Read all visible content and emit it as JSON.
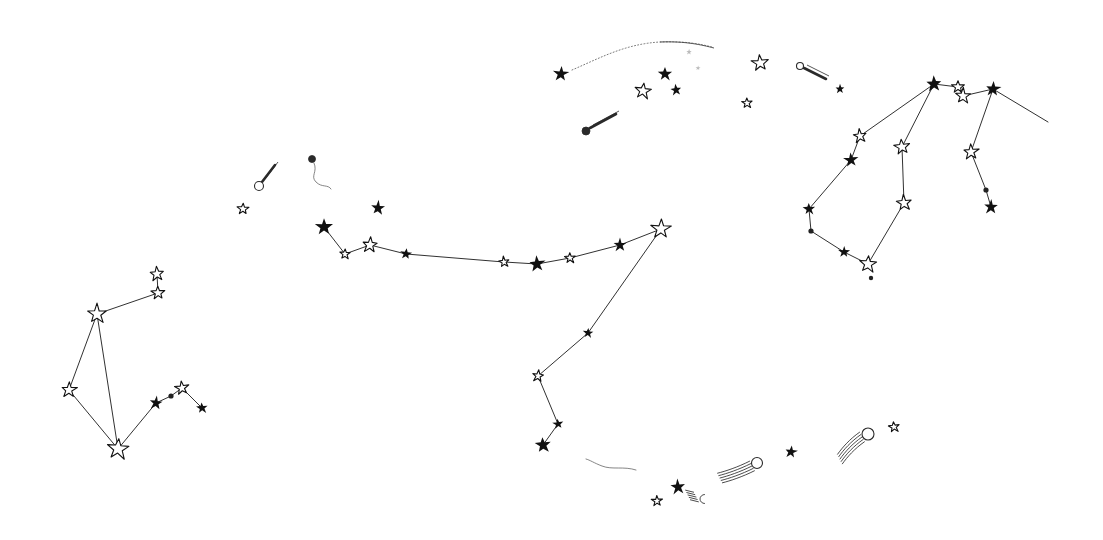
{
  "meta": {
    "background_color": "#ffffff",
    "ink_color": "#111111",
    "comet_ink_color": "#2a2a2a",
    "width": 1103,
    "height": 540
  },
  "chart_data": {
    "type": "scatter",
    "subtitle": "",
    "xlabel": "",
    "ylabel": "",
    "xlim": [
      0,
      1103
    ],
    "ylim": [
      0,
      540
    ],
    "grid": false,
    "legend": null,
    "annotations": [],
    "constellations": [
      {
        "name": "lower-left-group",
        "stars": [
          {
            "id": "ll1",
            "x": 157,
            "y": 274,
            "r": 7.5,
            "style": "open"
          },
          {
            "id": "ll2",
            "x": 158,
            "y": 293,
            "r": 7.0,
            "style": "open"
          },
          {
            "id": "ll3",
            "x": 97,
            "y": 314,
            "r": 10.0,
            "style": "open"
          },
          {
            "id": "ll4",
            "x": 69,
            "y": 390,
            "r": 8.0,
            "style": "open"
          },
          {
            "id": "ll5",
            "x": 118,
            "y": 449,
            "r": 11.0,
            "style": "open"
          },
          {
            "id": "ll6",
            "x": 156,
            "y": 403,
            "r": 7.0,
            "style": "solid"
          },
          {
            "id": "ll7",
            "x": 182,
            "y": 388,
            "r": 7.0,
            "style": "open"
          },
          {
            "id": "ll8",
            "x": 202,
            "y": 408,
            "r": 6.0,
            "style": "solid"
          },
          {
            "id": "ll9",
            "x": 171,
            "y": 396,
            "r": 2.6,
            "style": "solid"
          }
        ],
        "links": [
          [
            "ll1",
            "ll2"
          ],
          [
            "ll2",
            "ll3"
          ],
          [
            "ll3",
            "ll4"
          ],
          [
            "ll3",
            "ll5"
          ],
          [
            "ll4",
            "ll5"
          ],
          [
            "ll5",
            "ll6"
          ],
          [
            "ll6",
            "ll9"
          ],
          [
            "ll9",
            "ll7"
          ],
          [
            "ll7",
            "ll8"
          ]
        ]
      },
      {
        "name": "central-chain",
        "stars": [
          {
            "id": "c1",
            "x": 324,
            "y": 227,
            "r": 9.0,
            "style": "solid"
          },
          {
            "id": "c2",
            "x": 345,
            "y": 254,
            "r": 5.5,
            "style": "open"
          },
          {
            "id": "c3",
            "x": 370,
            "y": 245,
            "r": 8.0,
            "style": "open"
          },
          {
            "id": "c4",
            "x": 406,
            "y": 254,
            "r": 6.0,
            "style": "solid"
          },
          {
            "id": "c5",
            "x": 504,
            "y": 262,
            "r": 5.5,
            "style": "open"
          },
          {
            "id": "c6",
            "x": 537,
            "y": 264,
            "r": 8.5,
            "style": "solid"
          },
          {
            "id": "c7",
            "x": 570,
            "y": 258,
            "r": 5.5,
            "style": "open"
          },
          {
            "id": "c8",
            "x": 620,
            "y": 245,
            "r": 7.0,
            "style": "solid"
          },
          {
            "id": "c9",
            "x": 661,
            "y": 229,
            "r": 10.0,
            "style": "open"
          },
          {
            "id": "c10",
            "x": 588,
            "y": 333,
            "r": 5.5,
            "style": "solid"
          },
          {
            "id": "c11",
            "x": 538,
            "y": 376,
            "r": 6.0,
            "style": "open"
          },
          {
            "id": "c12",
            "x": 558,
            "y": 424,
            "r": 5.5,
            "style": "solid"
          },
          {
            "id": "c13",
            "x": 543,
            "y": 445,
            "r": 8.5,
            "style": "solid"
          }
        ],
        "links": [
          [
            "c1",
            "c2"
          ],
          [
            "c2",
            "c3"
          ],
          [
            "c3",
            "c4"
          ],
          [
            "c4",
            "c5"
          ],
          [
            "c5",
            "c6"
          ],
          [
            "c6",
            "c7"
          ],
          [
            "c7",
            "c8"
          ],
          [
            "c8",
            "c9"
          ],
          [
            "c9",
            "c10"
          ],
          [
            "c10",
            "c11"
          ],
          [
            "c11",
            "c12"
          ],
          [
            "c12",
            "c13"
          ]
        ]
      },
      {
        "name": "right-group",
        "stars": [
          {
            "id": "r1",
            "x": 934,
            "y": 84,
            "r": 8.5,
            "style": "solid"
          },
          {
            "id": "r2",
            "x": 958,
            "y": 87,
            "r": 6.5,
            "style": "open"
          },
          {
            "id": "r3",
            "x": 963,
            "y": 96,
            "r": 8.0,
            "style": "open"
          },
          {
            "id": "r4",
            "x": 993,
            "y": 89,
            "r": 8.0,
            "style": "solid"
          },
          {
            "id": "r5",
            "x": 1048,
            "y": 122,
            "r": 2.0,
            "style": "none"
          },
          {
            "id": "r6",
            "x": 860,
            "y": 136,
            "r": 7.0,
            "style": "open"
          },
          {
            "id": "r7",
            "x": 851,
            "y": 160,
            "r": 7.5,
            "style": "solid"
          },
          {
            "id": "r8",
            "x": 809,
            "y": 209,
            "r": 6.5,
            "style": "solid"
          },
          {
            "id": "r9",
            "x": 811,
            "y": 231,
            "r": 2.6,
            "style": "solid"
          },
          {
            "id": "r10",
            "x": 844,
            "y": 252,
            "r": 6.0,
            "style": "solid"
          },
          {
            "id": "r11",
            "x": 868,
            "y": 264,
            "r": 9.0,
            "style": "open"
          },
          {
            "id": "r12",
            "x": 871,
            "y": 278,
            "r": 2.2,
            "style": "solid"
          },
          {
            "id": "r13",
            "x": 902,
            "y": 147,
            "r": 8.0,
            "style": "open"
          },
          {
            "id": "r14",
            "x": 904,
            "y": 203,
            "r": 8.0,
            "style": "open"
          },
          {
            "id": "r15",
            "x": 971,
            "y": 152,
            "r": 8.0,
            "style": "open"
          },
          {
            "id": "r16",
            "x": 986,
            "y": 190,
            "r": 2.6,
            "style": "solid"
          },
          {
            "id": "r17",
            "x": 991,
            "y": 207,
            "r": 7.5,
            "style": "solid"
          }
        ],
        "links": [
          [
            "r1",
            "r2"
          ],
          [
            "r2",
            "r3"
          ],
          [
            "r3",
            "r4"
          ],
          [
            "r4",
            "r5"
          ],
          [
            "r1",
            "r6"
          ],
          [
            "r6",
            "r7"
          ],
          [
            "r7",
            "r8"
          ],
          [
            "r8",
            "r9"
          ],
          [
            "r9",
            "r10"
          ],
          [
            "r10",
            "r11"
          ],
          [
            "r1",
            "r13"
          ],
          [
            "r13",
            "r14"
          ],
          [
            "r14",
            "r11"
          ],
          [
            "r4",
            "r15"
          ],
          [
            "r15",
            "r16"
          ],
          [
            "r16",
            "r17"
          ]
        ]
      }
    ],
    "field_stars": [
      {
        "x": 561,
        "y": 74,
        "r": 8.0,
        "style": "solid"
      },
      {
        "x": 643,
        "y": 91,
        "r": 8.5,
        "style": "open"
      },
      {
        "x": 676,
        "y": 90,
        "r": 6.0,
        "style": "solid"
      },
      {
        "x": 760,
        "y": 63,
        "r": 8.5,
        "style": "open"
      },
      {
        "x": 747,
        "y": 103,
        "r": 5.5,
        "style": "open"
      },
      {
        "x": 840,
        "y": 89,
        "r": 5.0,
        "style": "solid"
      },
      {
        "x": 243,
        "y": 209,
        "r": 6.0,
        "style": "open"
      },
      {
        "x": 378,
        "y": 208,
        "r": 7.5,
        "style": "solid"
      },
      {
        "x": 791,
        "y": 452,
        "r": 6.5,
        "style": "solid"
      },
      {
        "x": 894,
        "y": 427,
        "r": 5.5,
        "style": "open"
      },
      {
        "x": 678,
        "y": 487,
        "r": 8.0,
        "style": "solid"
      },
      {
        "x": 657,
        "y": 501,
        "r": 5.5,
        "style": "open"
      },
      {
        "x": 665,
        "y": 74,
        "r": 7.5,
        "style": "solid"
      },
      {
        "x": 689,
        "y": 52,
        "r": 3.0,
        "style": "faint"
      },
      {
        "x": 698,
        "y": 68,
        "r": 2.5,
        "style": "faint"
      }
    ],
    "comets": [
      {
        "name": "comet-top-left-dotted",
        "head": {
          "x": 561,
          "y": 74,
          "r": 0
        },
        "trail": "M 572,70 C 600,58 625,44 660,42 C 686,41 700,44 712,47",
        "trail_style": "dotted"
      },
      {
        "name": "comet-upper-small",
        "head": {
          "x": 586,
          "y": 131,
          "r": 4.0,
          "style": "solid"
        },
        "trail": "M 590,128 L 616,114",
        "trail_style": "solid-thick"
      },
      {
        "name": "comet-left-small",
        "head": {
          "x": 259,
          "y": 186,
          "r": 4.5,
          "style": "open"
        },
        "trail": "M 262,182 L 275,165",
        "trail_style": "solid-thick"
      },
      {
        "name": "comet-left-wavy",
        "head": {
          "x": 312,
          "y": 159,
          "r": 3.5,
          "style": "solid"
        },
        "trail": "M 314,163 C 318,172 310,176 316,182 C 322,188 328,184 331,189",
        "trail_style": "wavy"
      },
      {
        "name": "comet-top-right",
        "head": {
          "x": 800,
          "y": 66,
          "r": 3.5,
          "style": "open"
        },
        "trail": "M 804,68 L 826,79",
        "trail_style": "solid-thick"
      },
      {
        "name": "comet-bottom-center",
        "head": {
          "x": 757,
          "y": 463,
          "r": 5.5,
          "style": "open"
        },
        "trail": "M 752,466 C 740,472 728,476 720,478",
        "trail_style": "feathered"
      },
      {
        "name": "comet-bottom-right",
        "head": {
          "x": 868,
          "y": 434,
          "r": 6.0,
          "style": "open"
        },
        "trail": "M 862,437 C 852,444 845,452 840,459",
        "trail_style": "feathered"
      },
      {
        "name": "comet-bottom-left-wisp",
        "head": {
          "x": 642,
          "y": 472,
          "r": 0
        },
        "trail": "M 636,470 C 624,466 612,470 602,466 C 594,463 590,460 586,459",
        "trail_style": "wavy"
      },
      {
        "name": "comet-bottom-crescent",
        "head": {
          "x": 700,
          "y": 499,
          "r": 4.5,
          "style": "crescent"
        },
        "trail": "M 696,497 L 688,495",
        "trail_style": "feathered"
      }
    ]
  }
}
